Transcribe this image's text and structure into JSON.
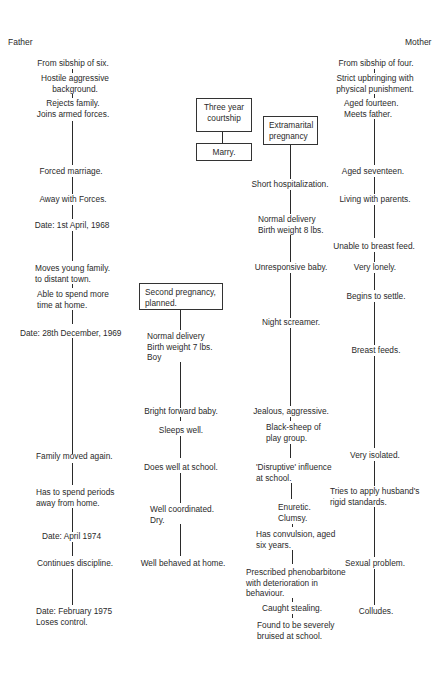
{
  "headers": {
    "left": "Father",
    "right": "Mother"
  },
  "father": [
    "From sibship of six.",
    "Hostile aggressive\nbackground.",
    "Rejects family.\nJoins armed forces.",
    "Forced marriage.",
    "Away with Forces.",
    "Date: 1st April, 1968",
    "Moves young family.\nto distant town.",
    "Able to spend more\ntime at home.",
    "Date: 28th December, 1969",
    "Family moved again.",
    "Has to spend periods\naway from home.",
    "Date: April 1974",
    "Continues discipline.",
    "Date: February 1975\nLoses control."
  ],
  "couple": {
    "courtship_box": "Three year\ncourtship",
    "marry_box": "Marry."
  },
  "second_child": {
    "box": "Second pregnancy,\nplanned.",
    "events": [
      "Normal delivery\nBirth weight 7 lbs.\nBoy",
      "Bright forward baby.",
      "Sleeps well.",
      "Does well at school.",
      "Well coordinated.\nDry.",
      "Well behaved at home."
    ]
  },
  "first_child": {
    "box": "Extramarital\npregnancy",
    "events": [
      "Short hospitalization.",
      "Normal delivery\nBirth weight 8 lbs.",
      "Unresponsive baby.",
      "Night screamer.",
      "Jealous, aggressive.",
      "Black-sheep of\nplay group.",
      "'Disruptive' influence\nat school.",
      "Enuretic.\nClumsy.",
      "Has convulsion, aged\nsix years.",
      "Prescribed phenobarbitone\nwith deterioration in\nbehaviour.",
      "Caught stealing.",
      "Found to be severely\nbruised at school."
    ]
  },
  "mother": [
    "From sibship of four.",
    "Strict upbringing with\nphysical punishment.",
    "Aged fourteen.\nMeets father.",
    "Aged seventeen.",
    "Living with parents.",
    "Unable to breast feed.",
    "Very lonely.",
    "Begins to settle.",
    "Breast feeds.",
    "Very isolated.",
    "Tries to apply husband's\nrigid standards.",
    "Sexual problem.",
    "Colludes."
  ]
}
